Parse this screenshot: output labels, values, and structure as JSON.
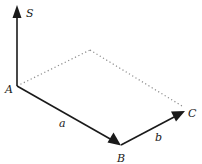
{
  "diagram": {
    "colors": {
      "line": "#1a1a1a",
      "dotted": "#8a8a8a",
      "background": "#ffffff"
    },
    "points": {
      "A": {
        "label": "A",
        "x": 17,
        "y": 86
      },
      "S": {
        "label": "S",
        "x": 17,
        "y": 6
      },
      "B": {
        "label": "B",
        "x": 120,
        "y": 145
      },
      "C": {
        "label": "C",
        "x": 184,
        "y": 112
      },
      "D": {
        "label": "",
        "x": 90,
        "y": 50
      }
    },
    "edges": [
      {
        "from": "A",
        "to": "S",
        "style": "solid-arrow",
        "label": ""
      },
      {
        "from": "A",
        "to": "B",
        "style": "solid-arrow",
        "label": "a"
      },
      {
        "from": "B",
        "to": "C",
        "style": "solid-arrow",
        "label": "b"
      },
      {
        "from": "A",
        "to": "D",
        "style": "dotted",
        "label": ""
      },
      {
        "from": "D",
        "to": "C",
        "style": "dotted",
        "label": ""
      }
    ],
    "labels": {
      "S": "S",
      "A": "A",
      "B": "B",
      "C": "C",
      "a": "a",
      "b": "b"
    }
  }
}
